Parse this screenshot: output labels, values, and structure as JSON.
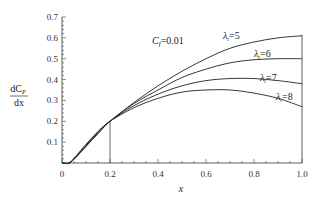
{
  "chart_data": {
    "type": "line",
    "title": "",
    "xlabel": "x",
    "ylabel": "dC_P/dx",
    "ylabel_num": "dC",
    "ylabel_sub": "P",
    "ylabel_den": "dx",
    "xlim": [
      0,
      1.0
    ],
    "ylim": [
      0,
      0.7
    ],
    "xticks": [
      "0",
      "0.2",
      "0.4",
      "0.6",
      "0.8",
      "1.0"
    ],
    "yticks": [
      "0.1",
      "0.2",
      "0.3",
      "0.4",
      "0.5",
      "0.6",
      "0.7"
    ],
    "grid": false,
    "annotation": {
      "label_c": "C",
      "label_sub": "f",
      "label_val": "=0.01"
    },
    "marker_line": {
      "x": 0.2,
      "y": 0.2
    },
    "x": [
      0,
      0.03,
      0.06,
      0.1,
      0.15,
      0.2,
      0.3,
      0.4,
      0.5,
      0.6,
      0.7,
      0.8,
      0.9,
      1.0
    ],
    "series": [
      {
        "name": "λt=5",
        "label_l": "λ",
        "label_s": "t",
        "label_v": "=5",
        "values": [
          0,
          0.0,
          0.03,
          0.08,
          0.14,
          0.2,
          0.29,
          0.37,
          0.44,
          0.5,
          0.55,
          0.58,
          0.6,
          0.61
        ]
      },
      {
        "name": "λt=6",
        "label_l": "λ",
        "label_s": "t",
        "label_v": "=6",
        "values": [
          0,
          0.0,
          0.03,
          0.08,
          0.145,
          0.2,
          0.285,
          0.35,
          0.41,
          0.45,
          0.48,
          0.495,
          0.5,
          0.5
        ]
      },
      {
        "name": "λt=7",
        "label_l": "λ",
        "label_s": "t",
        "label_v": "=7",
        "values": [
          0,
          0.0,
          0.035,
          0.085,
          0.15,
          0.2,
          0.275,
          0.33,
          0.37,
          0.395,
          0.405,
          0.405,
          0.395,
          0.38
        ]
      },
      {
        "name": "λt=8",
        "label_l": "λ",
        "label_s": "t",
        "label_v": "=8",
        "values": [
          0,
          0.0,
          0.035,
          0.09,
          0.15,
          0.2,
          0.265,
          0.31,
          0.34,
          0.35,
          0.35,
          0.335,
          0.31,
          0.27
        ]
      }
    ]
  }
}
